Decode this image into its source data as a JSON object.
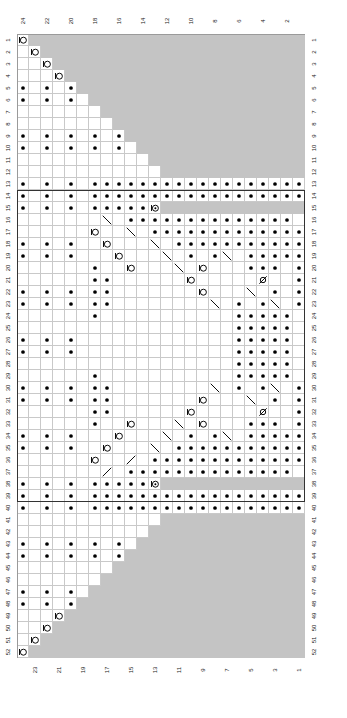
{
  "chart": {
    "type": "knitting-chart",
    "title": "",
    "columns": 24,
    "rows": 52,
    "cell_size_px": 12,
    "column_numbers_top": [
      24,
      22,
      20,
      18,
      16,
      14,
      12,
      10,
      8,
      6,
      4,
      2
    ],
    "column_numbers_bottom": [
      23,
      21,
      19,
      17,
      15,
      13,
      11,
      9,
      7,
      5,
      3,
      1
    ],
    "row_numbers": [
      1,
      2,
      3,
      4,
      5,
      6,
      7,
      8,
      9,
      10,
      11,
      12,
      13,
      14,
      15,
      16,
      17,
      18,
      19,
      20,
      21,
      22,
      23,
      24,
      25,
      26,
      27,
      28,
      29,
      30,
      31,
      32,
      33,
      34,
      35,
      36,
      37,
      38,
      39,
      40,
      41,
      42,
      43,
      44,
      45,
      46,
      47,
      48,
      49,
      50,
      51,
      52
    ],
    "colors": {
      "no_stitch_fill": "#c4c4c4",
      "grid_line": "#c9c9c9",
      "frame_line": "#9a9a9a",
      "repeat_border": "#333333",
      "symbol_ink": "#000000",
      "background": "#ffffff"
    },
    "repeat_box": {
      "from_row": 14,
      "to_row": 39,
      "from_col": 1,
      "to_col": 24
    },
    "symbol_names": {
      "purl": "purl-dot",
      "yo": "yarn-over-circle",
      "k2tog": "right-leaning-decrease",
      "ssk": "left-leaning-decrease",
      "cdd": "central-double-decrease",
      "nostitch": "no-stitch",
      "knit": "knit-blank"
    },
    "grid": [
      "O.......................",
      ".O......................",
      "..O.....................",
      "...O....................",
      "d.d.d.dO................",
      "d.d.d.d.O...............",
      ".........O..............",
      "..........O.............",
      "d.d.d.d.d.d.O...........",
      "d.d.d.d.d.d.d.O.........",
      "...............O........",
      "................O.......",
      "d.d.d.dddddddddddddddddd",
      "d.d.d.dddddddddddddddddd",
      "d.d.d.dddddc............",
      ".......\\.dddddddddddddd",
      "......y..\\.ddddddddddddd",
      "d.d.d..y...\\.ddddddddddd",
      "d.d.d...y...\\.d.d\\.ddddd",
      "......d..y...\\.y...ddd.d",
      "......dd......y.....s..d",
      "d.d.d.dd.......y...\\.d.d",
      "d.d.d.dd........\\.d.d\\.d",
      "......d...........ddddd.",
      "..................ddddd.",
      "d.d.d.............ddddd.",
      "d.d.d.............ddddd.",
      "..................ddddd.",
      "......d...........ddddd.",
      "d.d.d.dd........\\.d.d\\.d",
      "d.d.d.dd.......y...\\.d.d",
      "......dd......y.....s..d",
      "......d..y...\\.y...ddd.d",
      "d.d.d...y...\\.d.d\\.ddddd",
      "d.d.d..y...\\.ddddddddddd",
      "......y../.ddddddddddddd",
      "......./.dddddddddddddd.",
      "d.d.d.dddddc............",
      "d.d.d.dddddddddddddddddd",
      "d.d.d.dddddddddddddddddd",
      "................O.......",
      "...............O........",
      "d.d.d.d.d.d.d.O.........",
      "d.d.d.d.d.d.O...........",
      "..........O.............",
      ".........O..............",
      "d.d.d.d.O...............",
      "d.d.d.dO................",
      "...O....................",
      "..O.....................",
      ".O......................",
      "O......................."
    ]
  }
}
